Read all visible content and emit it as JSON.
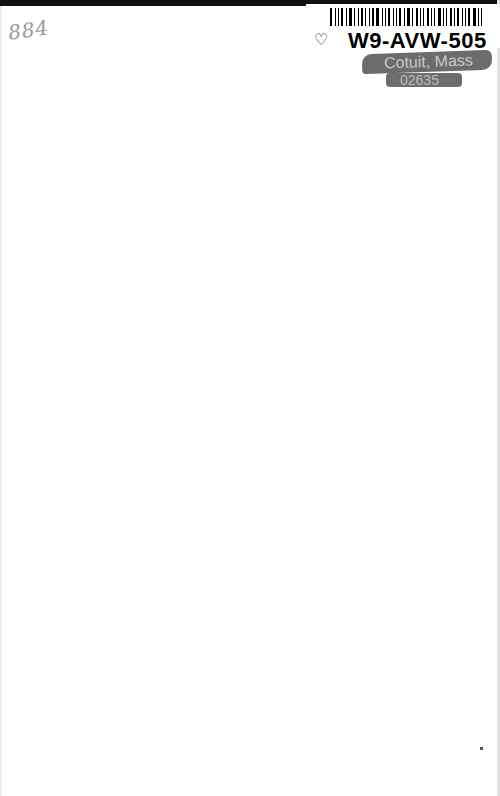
{
  "page": {
    "handwritten_note": "884",
    "label": {
      "barcode_text": "W9-AVW-505",
      "stamp_line1": "Cotuit, Mass",
      "stamp_line2": "02635"
    },
    "colors": {
      "background": "#ffffff",
      "top_bar": "#111111",
      "stamp": "#6c6c6c"
    }
  }
}
